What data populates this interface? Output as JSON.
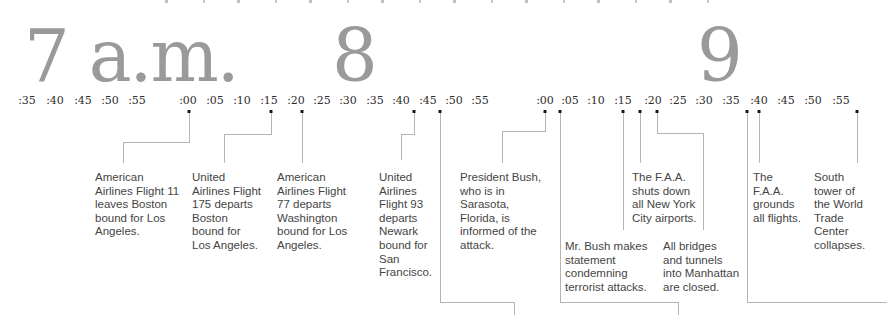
{
  "graphic": {
    "colors": {
      "background": "#ffffff",
      "hour_numeral": "#9a9a9a",
      "tick_text": "#2e2e2e",
      "event_text": "#454545",
      "connector_line": "#b5b5b5",
      "event_dot": "#1a1a1a"
    },
    "hours": [
      {
        "label": "7 a.m.",
        "x": 24
      },
      {
        "label": "8",
        "x": 332
      },
      {
        "label": "9",
        "x": 697
      }
    ],
    "ticks": [
      {
        "label": ":35",
        "x": 27
      },
      {
        "label": ":40",
        "x": 55
      },
      {
        "label": ":45",
        "x": 83
      },
      {
        "label": ":50",
        "x": 110
      },
      {
        "label": ":55",
        "x": 137
      },
      {
        "label": ":00",
        "x": 188
      },
      {
        "label": ":05",
        "x": 215
      },
      {
        "label": ":10",
        "x": 242
      },
      {
        "label": ":15",
        "x": 269
      },
      {
        "label": ":20",
        "x": 296
      },
      {
        "label": ":25",
        "x": 322
      },
      {
        "label": ":30",
        "x": 348
      },
      {
        "label": ":35",
        "x": 375
      },
      {
        "label": ":40",
        "x": 401
      },
      {
        "label": ":45",
        "x": 428
      },
      {
        "label": ":50",
        "x": 454
      },
      {
        "label": ":55",
        "x": 480
      },
      {
        "label": ":00",
        "x": 545
      },
      {
        "label": ":05",
        "x": 570
      },
      {
        "label": ":10",
        "x": 596
      },
      {
        "label": ":15",
        "x": 623
      },
      {
        "label": ":20",
        "x": 653
      },
      {
        "label": ":25",
        "x": 678
      },
      {
        "label": ":30",
        "x": 704
      },
      {
        "label": ":35",
        "x": 731
      },
      {
        "label": ":40",
        "x": 759
      },
      {
        "label": ":45",
        "x": 786
      },
      {
        "label": ":50",
        "x": 813
      },
      {
        "label": ":55",
        "x": 841
      }
    ],
    "events": [
      {
        "id": "aa-flight-11-departs",
        "time": "8:00",
        "dot_x": 189,
        "text": "American\nAirlines Flight 11\nleaves Boston\nbound for Los\nAngeles.",
        "text_left": 95,
        "text_top": 171,
        "path": [
          [
            189,
            113
          ],
          [
            189,
            142
          ],
          [
            123,
            142
          ],
          [
            123,
            163
          ]
        ]
      },
      {
        "id": "ua-flight-175-departs",
        "time": "8:15",
        "dot_x": 271,
        "text": "United\nAirlines Flight\n175 departs\nBoston\nbound for\nLos Angeles.",
        "text_left": 192,
        "text_top": 171,
        "path": [
          [
            271,
            113
          ],
          [
            271,
            134
          ],
          [
            224,
            134
          ],
          [
            224,
            163
          ]
        ]
      },
      {
        "id": "aa-flight-77-departs",
        "time": "8:20",
        "dot_x": 302,
        "text": "American\nAirlines Flight\n77 departs\nWashington\nbound for Los\nAngeles.",
        "text_left": 277,
        "text_top": 171,
        "path": [
          [
            302,
            113
          ],
          [
            302,
            163
          ]
        ]
      },
      {
        "id": "ua-flight-93-departs",
        "time": "8:42",
        "dot_x": 414,
        "text": "United\nAirlines\nFlight 93\ndeparts\nNewark\nbound for\nSan\nFrancisco.",
        "text_left": 379,
        "text_top": 171,
        "path": [
          [
            414,
            113
          ],
          [
            414,
            134
          ],
          [
            401,
            134
          ],
          [
            401,
            160
          ]
        ]
      },
      {
        "id": "offscreen-event-1",
        "time": "8:46",
        "dot_x": 440,
        "text": "",
        "path": [
          [
            440,
            113
          ],
          [
            440,
            302
          ],
          [
            514,
            302
          ],
          [
            514,
            315
          ]
        ]
      },
      {
        "id": "bush-informed-of-attack",
        "time": "9:00",
        "dot_x": 545,
        "text": "President Bush,\nwho is in\nSarasota,\nFlorida, is\ninformed of the\nattack.",
        "text_left": 460,
        "text_top": 171,
        "path": [
          [
            545,
            113
          ],
          [
            545,
            131
          ],
          [
            502,
            131
          ],
          [
            502,
            163
          ]
        ]
      },
      {
        "id": "offscreen-event-2",
        "time": "9:03",
        "dot_x": 560,
        "text": "",
        "path": [
          [
            560,
            113
          ],
          [
            560,
            302
          ],
          [
            678,
            302
          ],
          [
            678,
            315
          ]
        ]
      },
      {
        "id": "bush-statement",
        "time": "9:15",
        "dot_x": 623,
        "text": "Mr. Bush makes\nstatement\ncondemning\nterrorist attacks.",
        "text_left": 565,
        "text_top": 240,
        "path": [
          [
            623,
            113
          ],
          [
            623,
            230
          ]
        ]
      },
      {
        "id": "faa-shuts-nyc-airports",
        "time": "9:17",
        "dot_x": 640,
        "text": "The F.A.A.\nshuts down\nall New York\nCity airports.",
        "text_left": 632,
        "text_top": 171,
        "path": [
          [
            640,
            113
          ],
          [
            640,
            163
          ]
        ]
      },
      {
        "id": "bridges-tunnels-closed",
        "time": "9:21",
        "dot_x": 657,
        "text": "All bridges\nand tunnels\ninto Manhattan\nare closed.",
        "text_left": 663,
        "text_top": 240,
        "path": [
          [
            657,
            113
          ],
          [
            657,
            133
          ],
          [
            703,
            133
          ],
          [
            703,
            230
          ]
        ]
      },
      {
        "id": "offscreen-event-3",
        "time": "9:37",
        "dot_x": 747,
        "text": "",
        "path": [
          [
            747,
            113
          ],
          [
            747,
            302
          ],
          [
            887,
            302
          ]
        ]
      },
      {
        "id": "faa-grounds-all-flights",
        "time": "9:40",
        "dot_x": 759,
        "text": "The\nF.A.A.\ngrounds\nall flights.",
        "text_left": 753,
        "text_top": 171,
        "path": [
          [
            759,
            113
          ],
          [
            759,
            163
          ]
        ]
      },
      {
        "id": "south-tower-collapses",
        "time": "9:59",
        "dot_x": 857,
        "text": "South\ntower of\nthe World\nTrade\nCenter\ncollapses.",
        "text_left": 814,
        "text_top": 171,
        "path": [
          [
            857,
            113
          ],
          [
            857,
            163
          ]
        ]
      }
    ]
  }
}
